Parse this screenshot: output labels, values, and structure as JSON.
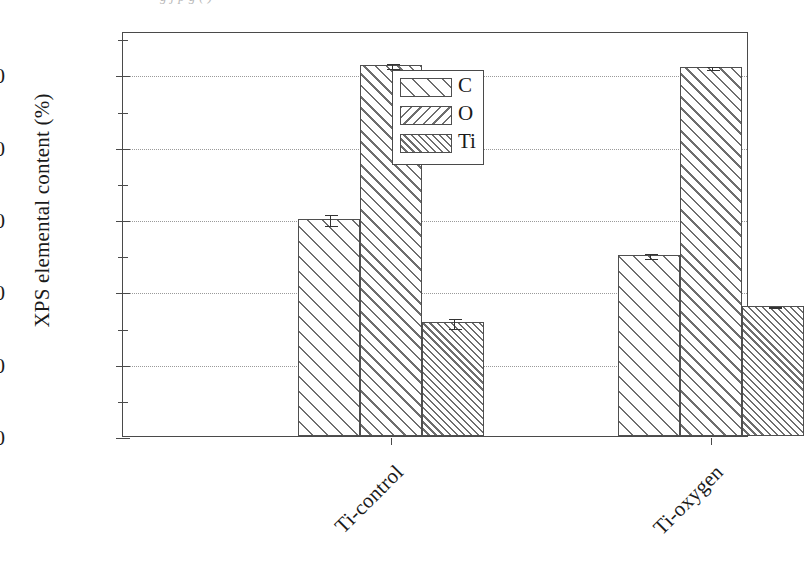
{
  "caption": {
    "clipped_text": "g     j     p   g              ( )"
  },
  "chart_data": {
    "type": "bar",
    "title": "",
    "xlabel": "",
    "ylabel": "XPS elemental content (%)",
    "categories": [
      "Ti-control",
      "Ti-oxygen"
    ],
    "series": [
      {
        "name": "C",
        "values": [
          30.0,
          25.0
        ],
        "errors": [
          0.8,
          0.4
        ],
        "hatch": "wide-forward-diagonal"
      },
      {
        "name": "O",
        "values": [
          51.3,
          51.0
        ],
        "errors": [
          0.4,
          0.3
        ],
        "hatch": "medium-backward-diagonal"
      },
      {
        "name": "Ti",
        "values": [
          15.7,
          18.0
        ],
        "errors": [
          0.7,
          0.15
        ],
        "hatch": "dense-forward-diagonal"
      }
    ],
    "ylim": [
      0,
      56
    ],
    "ytick_labels": [
      "0",
      "10",
      "20",
      "30",
      "40",
      "50"
    ],
    "ytick_values": [
      0,
      10,
      20,
      30,
      40,
      50
    ],
    "yminor_tick_values": [
      5,
      15,
      25,
      35,
      45,
      55
    ],
    "grid": true,
    "grid_axis": "y",
    "grid_style": "dotted",
    "legend_position": "upper center",
    "legend_entries": [
      "C",
      "O",
      "Ti"
    ],
    "error_bars": true,
    "colors": {
      "axis": "#4a4a4a",
      "grid": "#9a9a9a",
      "hatch": "#6e6e6e",
      "bar_edge": "#4f4f4f",
      "background": "#ffffff",
      "text": "#1a1a1a"
    }
  }
}
